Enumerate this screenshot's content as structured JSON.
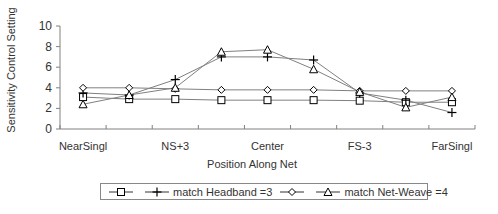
{
  "chart_data": {
    "type": "line",
    "title": "",
    "xlabel": "Position Along Net",
    "ylabel": "Sensitivity Control Setting",
    "ylim": [
      0,
      10
    ],
    "yticks": [
      0,
      2,
      4,
      6,
      8,
      10
    ],
    "grid": false,
    "legend_position": "bottom",
    "categories": [
      "NearSingl",
      "",
      "NS+3",
      "",
      "Center",
      "",
      "FS-3",
      "",
      "FarSingl"
    ],
    "category_tick_labels": [
      "NearSingl",
      "NS+3",
      "Center",
      "FS-3",
      "FarSingl"
    ],
    "series": [
      {
        "name": "",
        "marker": "square",
        "values": [
          3.1,
          2.9,
          2.9,
          2.8,
          2.8,
          2.8,
          2.75,
          2.6,
          2.6
        ]
      },
      {
        "name": "match Headband =3",
        "marker": "plus",
        "values": [
          3.5,
          3.3,
          4.8,
          7.0,
          7.0,
          6.7,
          3.5,
          2.8,
          1.6
        ]
      },
      {
        "name": "",
        "marker": "diamond",
        "values": [
          4.0,
          4.0,
          3.9,
          3.8,
          3.8,
          3.8,
          3.7,
          3.7,
          3.7
        ]
      },
      {
        "name": "match Net-Weave =4",
        "marker": "triangle",
        "values": [
          2.4,
          3.3,
          4.0,
          7.5,
          7.7,
          5.8,
          3.6,
          2.1,
          3.1
        ]
      }
    ]
  },
  "axis": {
    "ylabel": "Sensitivity Control Setting",
    "xlabel": "Position Along Net"
  },
  "legend": {
    "items": [
      {
        "label": "",
        "marker": "square"
      },
      {
        "label": "match Headband =3",
        "marker": "plus"
      },
      {
        "label": "",
        "marker": "diamond"
      },
      {
        "label": "match Net-Weave =4",
        "marker": "triangle"
      }
    ]
  },
  "colors": {
    "line": "#808080",
    "marker": "#000000",
    "axis": "#808080",
    "text": "#333333"
  }
}
